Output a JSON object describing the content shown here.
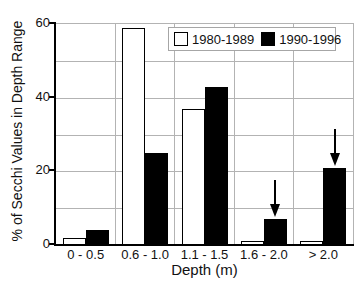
{
  "chart_data": {
    "type": "bar",
    "title": "",
    "categories": [
      "0 - 0.5",
      "0.6 - 1.0",
      "1.1 - 1.5",
      "1.6 - 2.0",
      "> 2.0"
    ],
    "series": [
      {
        "name": "1980-1989",
        "color": "#ffffff",
        "values": [
          2,
          59,
          37,
          1,
          1
        ]
      },
      {
        "name": "1990-1996",
        "color": "#000000",
        "values": [
          4,
          25,
          43,
          7,
          21
        ]
      }
    ],
    "xlabel": "Depth (m)",
    "ylabel": "% of Secchi Values in Depth Range",
    "ylim": [
      0,
      60
    ],
    "yticks": [
      "0",
      "20",
      "40",
      "60"
    ],
    "grid_step": 10,
    "grid": "on",
    "legend_position": "top-right",
    "annotations": [
      {
        "type": "down-arrow",
        "series": "1990-1996",
        "category": "1.6 - 2.0"
      },
      {
        "type": "down-arrow",
        "series": "1990-1996",
        "category": "> 2.0"
      }
    ]
  },
  "colors": {
    "background": "#ffffff",
    "axis": "#000000",
    "grid": "#b3b3b3",
    "text": "#111111"
  }
}
